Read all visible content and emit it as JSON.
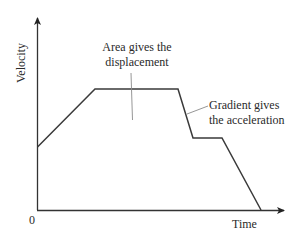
{
  "diagram": {
    "type": "velocity-time graph",
    "axes": {
      "y_label": "Velocity",
      "x_label": "Time",
      "origin_label": "0"
    },
    "annotations": {
      "area": {
        "line1": "Area gives the",
        "line2": "displacement"
      },
      "gradient": {
        "line1": "Gradient gives",
        "line2": "the acceleration"
      }
    },
    "segments": [
      {
        "name": "acceleration",
        "description": "constant acceleration from non-zero initial velocity"
      },
      {
        "name": "constant-velocity-high",
        "description": "constant velocity"
      },
      {
        "name": "deceleration-1",
        "description": "steep deceleration"
      },
      {
        "name": "constant-velocity-low",
        "description": "constant lower velocity"
      },
      {
        "name": "deceleration-2",
        "description": "deceleration to rest"
      }
    ],
    "colors": {
      "axis": "#333333",
      "curve": "#3a3a3a",
      "leader": "#888888",
      "text": "#2a2a2a"
    }
  }
}
